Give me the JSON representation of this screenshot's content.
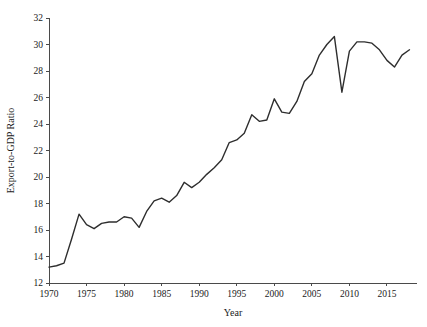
{
  "chart_data": {
    "type": "line",
    "title": "",
    "subtitle": "",
    "xlabel": "Year",
    "ylabel": "Export-to-GDP Ratio",
    "xlim": [
      1970,
      2019
    ],
    "ylim": [
      12,
      32
    ],
    "grid": false,
    "legend": null,
    "line_color": "#2e2e2e",
    "x_ticks": [
      1970,
      1975,
      1980,
      1985,
      1990,
      1995,
      2000,
      2005,
      2010,
      2015
    ],
    "x_tick_labels": [
      "1970",
      "1975",
      "1980",
      "1985",
      "1990",
      "1995",
      "2000",
      "2005",
      "2010",
      "2015"
    ],
    "y_ticks": [
      12,
      14,
      16,
      18,
      20,
      22,
      24,
      26,
      28,
      30,
      32
    ],
    "y_tick_labels": [
      "12",
      "14",
      "16",
      "18",
      "20",
      "22",
      "24",
      "26",
      "28",
      "30",
      "32"
    ],
    "x": [
      1970,
      1971,
      1972,
      1973,
      1974,
      1975,
      1976,
      1977,
      1978,
      1979,
      1980,
      1981,
      1982,
      1983,
      1984,
      1985,
      1986,
      1987,
      1988,
      1989,
      1990,
      1991,
      1992,
      1993,
      1994,
      1995,
      1996,
      1997,
      1998,
      1999,
      2000,
      2001,
      2002,
      2003,
      2004,
      2005,
      2006,
      2007,
      2008,
      2009,
      2010,
      2011,
      2012,
      2013,
      2014,
      2015,
      2016,
      2017,
      2018
    ],
    "values": [
      13.2,
      13.3,
      13.5,
      15.3,
      17.2,
      16.4,
      16.1,
      16.5,
      16.6,
      16.6,
      17.0,
      16.9,
      16.2,
      17.4,
      18.2,
      18.4,
      18.1,
      18.6,
      19.6,
      19.2,
      19.6,
      20.2,
      20.7,
      21.3,
      22.6,
      22.8,
      23.3,
      24.7,
      24.2,
      24.3,
      25.9,
      24.9,
      24.8,
      25.7,
      27.2,
      27.8,
      29.2,
      30.0,
      30.6,
      26.4,
      29.5,
      30.2,
      30.2,
      30.1,
      29.6,
      28.8,
      28.3,
      29.2,
      29.6
    ]
  },
  "axes": {
    "y_axis_label": "Export-to-GDP Ratio",
    "x_axis_label": "Year"
  }
}
